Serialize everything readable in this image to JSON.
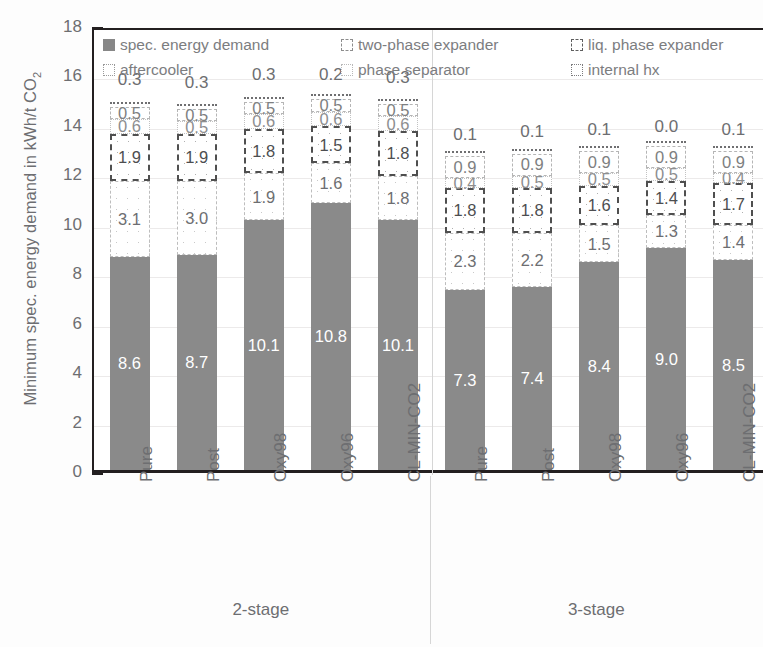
{
  "chart_data": {
    "type": "bar",
    "subtype": "stacked-bar",
    "title": "",
    "xlabel": "",
    "ylabel": "Minimum spec. energy demand in kWh/t CO2",
    "ylabel_parts": {
      "main": "Minimum spec. energy demand in kWh/t CO",
      "sub": "2"
    },
    "ylim": [
      0,
      18
    ],
    "yticks": [
      0,
      2,
      4,
      6,
      8,
      10,
      12,
      14,
      16,
      18
    ],
    "ytick_labels": [
      "0",
      "2",
      "4",
      "6",
      "8",
      "10",
      "12",
      "14",
      "16",
      "18"
    ],
    "yminor_ticks": [
      1,
      3,
      5,
      7,
      9,
      11,
      13,
      15,
      17
    ],
    "grid": true,
    "legend_position": "top-inside",
    "categories": [
      "Pure",
      "Post",
      "Oxy98",
      "Oxy96",
      "CL-MIN-CO2",
      "Pure",
      "Post",
      "Oxy98",
      "Oxy96",
      "CL-MIN-CO2"
    ],
    "groups": [
      {
        "label": "2-stage",
        "categories": [
          "Pure",
          "Post",
          "Oxy98",
          "Oxy96",
          "CL-MIN-CO2"
        ]
      },
      {
        "label": "3-stage",
        "categories": [
          "Pure",
          "Post",
          "Oxy98",
          "Oxy96",
          "CL-MIN-CO2"
        ]
      }
    ],
    "series": [
      {
        "name": "spec. energy demand",
        "key": "base",
        "values": [
          8.6,
          8.7,
          10.1,
          10.8,
          10.1,
          7.3,
          7.4,
          8.4,
          9.0,
          8.5
        ]
      },
      {
        "name": "aftercooler",
        "key": "aftercooler",
        "values": [
          3.1,
          3.0,
          1.9,
          1.6,
          1.8,
          2.3,
          2.2,
          1.5,
          1.3,
          1.4
        ]
      },
      {
        "name": "liq. phase expander",
        "key": "liq",
        "values": [
          1.9,
          1.9,
          1.8,
          1.5,
          1.8,
          1.8,
          1.8,
          1.6,
          1.4,
          1.7
        ]
      },
      {
        "name": "phase separator",
        "key": "sep",
        "values": [
          0.6,
          0.5,
          0.6,
          0.6,
          0.6,
          0.4,
          0.5,
          0.5,
          0.5,
          0.4
        ]
      },
      {
        "name": "two-phase expander",
        "key": "twophase",
        "values": [
          0.5,
          0.5,
          0.5,
          0.5,
          0.5,
          0.9,
          0.9,
          0.9,
          0.9,
          0.9
        ]
      },
      {
        "name": "internal hx",
        "key": "hx",
        "values": [
          0.3,
          0.3,
          0.3,
          0.2,
          0.3,
          0.1,
          0.1,
          0.1,
          0.0,
          0.1
        ]
      }
    ],
    "bar_labels": [
      {
        "category": "Pure",
        "group": "2-stage",
        "base": "8.6",
        "aftercooler": "3.1",
        "liq": "1.9",
        "sep": "0.6",
        "twophase": "0.5",
        "hx": "0.3"
      },
      {
        "category": "Post",
        "group": "2-stage",
        "base": "8.7",
        "aftercooler": "3.0",
        "liq": "1.9",
        "sep": "0.5",
        "twophase": "0.5",
        "hx": "0.3"
      },
      {
        "category": "Oxy98",
        "group": "2-stage",
        "base": "10.1",
        "aftercooler": "1.9",
        "liq": "1.8",
        "sep": "0.6",
        "twophase": "0.5",
        "hx": "0.3"
      },
      {
        "category": "Oxy96",
        "group": "2-stage",
        "base": "10.8",
        "aftercooler": "1.6",
        "liq": "1.5",
        "sep": "0.6",
        "twophase": "0.5",
        "hx": "0.2"
      },
      {
        "category": "CL-MIN-CO2",
        "group": "2-stage",
        "base": "10.1",
        "aftercooler": "1.8",
        "liq": "1.8",
        "sep": "0.6",
        "twophase": "0.5",
        "hx": "0.3"
      },
      {
        "category": "Pure",
        "group": "3-stage",
        "base": "7.3",
        "aftercooler": "2.3",
        "liq": "1.8",
        "sep": "0.4",
        "twophase": "0.9",
        "hx": "0.1"
      },
      {
        "category": "Post",
        "group": "3-stage",
        "base": "7.4",
        "aftercooler": "2.2",
        "liq": "1.8",
        "sep": "0.5",
        "twophase": "0.9",
        "hx": "0.1"
      },
      {
        "category": "Oxy98",
        "group": "3-stage",
        "base": "8.4",
        "aftercooler": "1.5",
        "liq": "1.6",
        "sep": "0.5",
        "twophase": "0.9",
        "hx": "0.1"
      },
      {
        "category": "Oxy96",
        "group": "3-stage",
        "base": "9.0",
        "aftercooler": "1.3",
        "liq": "1.4",
        "sep": "0.5",
        "twophase": "0.9",
        "hx": "0.0"
      },
      {
        "category": "CL-MIN-CO2",
        "group": "3-stage",
        "base": "8.5",
        "aftercooler": "1.4",
        "liq": "1.7",
        "sep": "0.4",
        "twophase": "0.9",
        "hx": "0.1"
      }
    ],
    "colors": {
      "base": "#8a8a8a",
      "aftercooler": "#bdbdbd",
      "liq": "#4f4f4f",
      "sep": "#c2c2c2",
      "twophase": "#b5b5b5",
      "hx": "#6f6f71",
      "axis": "#231f20",
      "text": "#6d6e71",
      "grid": "#eceaea"
    }
  },
  "legend": {
    "entries": [
      {
        "label": "spec. energy demand",
        "swatch": "sw-solid",
        "icon": "legend-swatch-solid-icon"
      },
      {
        "label": "two-phase expander",
        "swatch": "sw-dash",
        "icon": "legend-swatch-dashed-icon"
      },
      {
        "label": "liq. phase expander",
        "swatch": "sw-dashdot",
        "icon": "legend-swatch-dashdot-icon"
      },
      {
        "label": "aftercooler",
        "swatch": "sw-dot",
        "icon": "legend-swatch-dotted-icon"
      },
      {
        "label": "phase separator",
        "swatch": "sw-dot-light",
        "icon": "legend-swatch-dotted-light-icon"
      },
      {
        "label": "internal hx",
        "swatch": "sw-wave",
        "icon": "legend-swatch-wave-icon"
      }
    ]
  }
}
